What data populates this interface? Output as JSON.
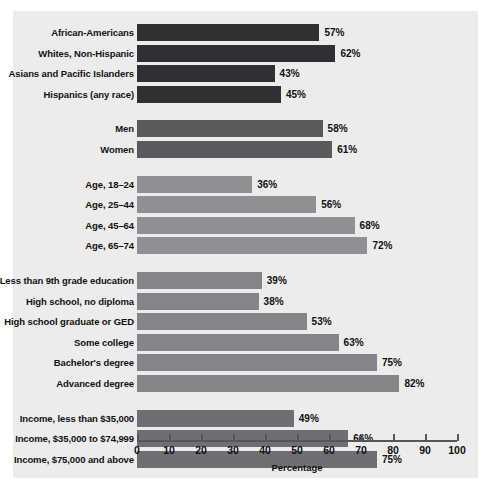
{
  "chart_data": {
    "type": "bar",
    "orientation": "horizontal",
    "title": "",
    "xlabel": "Percentage",
    "ylabel": "",
    "xlim": [
      0,
      100
    ],
    "xticks": [
      0,
      10,
      20,
      30,
      40,
      50,
      60,
      70,
      80,
      90,
      100
    ],
    "grid": false,
    "legend": "none",
    "value_suffix": "%",
    "categories": [
      "African-Americans",
      "Whites, Non-Hispanic",
      "Asians and Pacific Islanders",
      "Hispanics (any race)",
      "Men",
      "Women",
      "Age, 18–24",
      "Age, 25–44",
      "Age, 45–64",
      "Age, 65–74",
      "Less than 9th grade education",
      "High school, no diploma",
      "High school graduate or GED",
      "Some college",
      "Bachelor's degree",
      "Advanced degree",
      "Income, less than $35,000",
      "Income, $35,000 to $74,999",
      "Income, $75,000 and above"
    ],
    "values": [
      57,
      62,
      43,
      45,
      58,
      61,
      36,
      56,
      68,
      72,
      39,
      38,
      53,
      63,
      75,
      82,
      49,
      66,
      75
    ],
    "groups": [
      {
        "name": "race-ethnicity",
        "color": "#2f3033",
        "bars": [
          {
            "label": "African-Americans",
            "value": 57,
            "value_label": "57%"
          },
          {
            "label": "Whites, Non-Hispanic",
            "value": 62,
            "value_label": "62%"
          },
          {
            "label": "Asians and Pacific Islanders",
            "value": 43,
            "value_label": "43%"
          },
          {
            "label": "Hispanics (any race)",
            "value": 45,
            "value_label": "45%"
          }
        ]
      },
      {
        "name": "sex",
        "color": "#585a5e",
        "bars": [
          {
            "label": "Men",
            "value": 58,
            "value_label": "58%"
          },
          {
            "label": "Women",
            "value": 61,
            "value_label": "61%"
          }
        ]
      },
      {
        "name": "age",
        "color": "#8e9094",
        "bars": [
          {
            "label": "Age, 18–24",
            "value": 36,
            "value_label": "36%"
          },
          {
            "label": "Age, 25–44",
            "value": 56,
            "value_label": "56%"
          },
          {
            "label": "Age, 45–64",
            "value": 68,
            "value_label": "68%"
          },
          {
            "label": "Age, 65–74",
            "value": 72,
            "value_label": "72%"
          }
        ]
      },
      {
        "name": "education",
        "color": "#83858a",
        "bars": [
          {
            "label": "Less than 9th grade education",
            "value": 39,
            "value_label": "39%"
          },
          {
            "label": "High school, no diploma",
            "value": 38,
            "value_label": "38%"
          },
          {
            "label": "High school graduate or GED",
            "value": 53,
            "value_label": "53%"
          },
          {
            "label": "Some college",
            "value": 63,
            "value_label": "63%"
          },
          {
            "label": "Bachelor's degree",
            "value": 75,
            "value_label": "75%"
          },
          {
            "label": "Advanced degree",
            "value": 82,
            "value_label": "82%"
          }
        ]
      },
      {
        "name": "income",
        "color": "#6d6f73",
        "bars": [
          {
            "label": "Income, less than $35,000",
            "value": 49,
            "value_label": "49%"
          },
          {
            "label": "Income, $35,000 to $74,999",
            "value": 66,
            "value_label": "66%"
          },
          {
            "label": "Income, $75,000 and above",
            "value": 75,
            "value_label": "75%"
          }
        ]
      }
    ]
  },
  "axis": {
    "title": "Percentage",
    "tick_labels": [
      "0",
      "10",
      "20",
      "30",
      "40",
      "50",
      "60",
      "70",
      "80",
      "90",
      "100"
    ]
  },
  "colors": {
    "panel_background": "#ececec",
    "page_background": "#ffffff",
    "axis": "#55555a",
    "text": "#111111"
  }
}
